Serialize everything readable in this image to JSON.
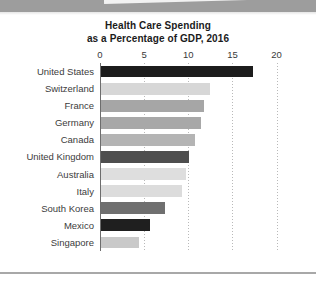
{
  "chart_data": {
    "type": "bar",
    "orientation": "horizontal",
    "title": "Health Care Spending as a Percentage of GDP, 2016",
    "title_lines": [
      "Health Care Spending",
      "as a Percentage of GDP, 2016"
    ],
    "xlabel": "",
    "ylabel": "",
    "xlim": [
      0,
      20
    ],
    "xticks": [
      0,
      5,
      10,
      15,
      20
    ],
    "xtick_labels": [
      "0",
      "5",
      "10",
      "15",
      "20"
    ],
    "grid": "vertical-dotted",
    "legend": "none",
    "categories": [
      "United States",
      "Switzerland",
      "France",
      "Germany",
      "Canada",
      "United Kingdom",
      "Australia",
      "Italy",
      "South Korea",
      "Mexico",
      "Singapore"
    ],
    "values": [
      17.2,
      12.3,
      11.7,
      11.3,
      10.6,
      10.0,
      9.6,
      9.2,
      7.3,
      5.5,
      4.3
    ],
    "bar_colors": [
      "#1c1c1c",
      "#d7d7d7",
      "#a6a6a6",
      "#a8a8a8",
      "#b4b4b4",
      "#4e4e4e",
      "#dedede",
      "#dcdcdc",
      "#6f6f6f",
      "#1f1f1f",
      "#c9c9c9"
    ]
  },
  "colors": {
    "background": "#ffffff",
    "banner": "#9d9d9d",
    "axis": "#6d6d6d",
    "gridline": "#b9b9b9",
    "text": "#3c3c3c",
    "title_text": "#1b1b1b"
  }
}
